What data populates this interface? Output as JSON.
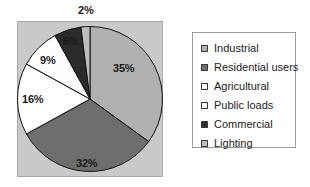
{
  "chart_data": {
    "type": "pie",
    "title": "",
    "categories": [
      "Industrial",
      "Residential users",
      "Agricultural",
      "Public loads",
      "Commercial",
      "Lighting"
    ],
    "values": [
      35,
      32,
      16,
      9,
      6,
      2
    ],
    "value_labels": [
      "35%",
      "32%",
      "16%",
      "9%",
      "6%",
      "2%"
    ],
    "unit": "%",
    "colors": [
      "#b0b0b0",
      "#6e6e6e",
      "#ffffff",
      "#fdfdfd",
      "#2b2b2b",
      "#bdbdbd"
    ],
    "legend_position": "right",
    "grid": false,
    "start_angle_deg": 0,
    "direction": "clockwise",
    "plot_background": "#c9c9c9",
    "slice_outline": "#101010"
  },
  "plot": {
    "labels": [
      {
        "text": "35%",
        "left": 113,
        "top": 62
      },
      {
        "text": "32%",
        "left": 76,
        "top": 157
      },
      {
        "text": "16%",
        "left": 22,
        "top": 93
      },
      {
        "text": "9%",
        "left": 40,
        "top": 54
      },
      {
        "text": "6%",
        "left": 63,
        "top": 35
      },
      {
        "text": "2%",
        "left": 78,
        "top": 4
      }
    ]
  },
  "legend": {
    "items": [
      {
        "label": "Industrial",
        "color": "#b0b0b0"
      },
      {
        "label": "Residential users",
        "color": "#6e6e6e"
      },
      {
        "label": "Agricultural",
        "color": "#ffffff"
      },
      {
        "label": "Public loads",
        "color": "#fdfdfd"
      },
      {
        "label": "Commercial",
        "color": "#2b2b2b"
      },
      {
        "label": "Lighting",
        "color": "#bdbdbd"
      }
    ]
  }
}
